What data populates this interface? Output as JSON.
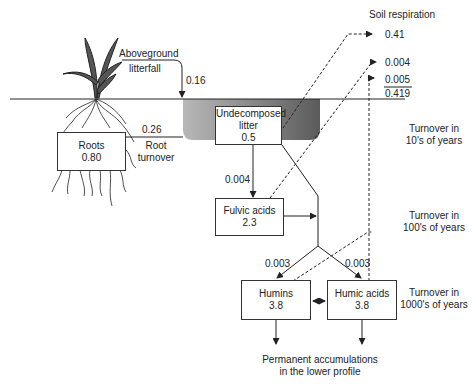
{
  "diagram": {
    "header": {
      "soil_respiration": "Soil respiration"
    },
    "outputs": {
      "resp_1": "0.41",
      "resp_2": "0.004",
      "resp_3": "0.005",
      "resp_total": "0.419"
    },
    "flows": {
      "aboveground_litterfall_label_1": "Aboveground",
      "aboveground_litterfall_label_2": "litterfall",
      "aboveground_litterfall_value": "0.16",
      "root_turnover_value": "0.26",
      "root_turnover_label_1": "Root",
      "root_turnover_label_2": "turnover",
      "litter_to_fulvic": "0.004",
      "to_humins": "0.003",
      "to_humic": "0.003"
    },
    "pools": {
      "roots": {
        "name": "Roots",
        "value": "0.80"
      },
      "litter": {
        "name_1": "Undecomposed",
        "name_2": "litter",
        "value": "0.5"
      },
      "fulvic": {
        "name": "Fulvic acids",
        "value": "2.3"
      },
      "humins": {
        "name": "Humins",
        "value": "3.8"
      },
      "humic": {
        "name": "Humic acids",
        "value": "3.8"
      }
    },
    "turnover": {
      "t10_1": "Turnover in",
      "t10_2": "10's of years",
      "t100_1": "Turnover in",
      "t100_2": "100's of years",
      "t1000_1": "Turnover in",
      "t1000_2": "1000's of years"
    },
    "footer": {
      "line_1": "Permanent accumulations",
      "line_2": "in the lower profile"
    }
  }
}
